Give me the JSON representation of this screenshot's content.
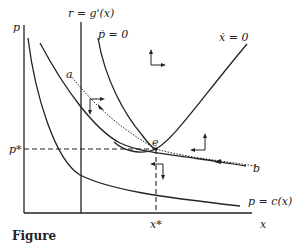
{
  "diagram": {
    "type": "phase-diagram",
    "axes": {
      "y_label": "p",
      "x_label": "x"
    },
    "labels": {
      "marginal_condition": "r = g'(x)",
      "p_dot_zero": "ṗ = 0",
      "x_dot_zero": "ẋ = 0",
      "cost_curve": "p = c(x)",
      "equilibrium": "e",
      "path_start_a": "a",
      "path_start_b": "b",
      "p_star": "p*",
      "x_star": "x*"
    },
    "caption": "Figure"
  }
}
